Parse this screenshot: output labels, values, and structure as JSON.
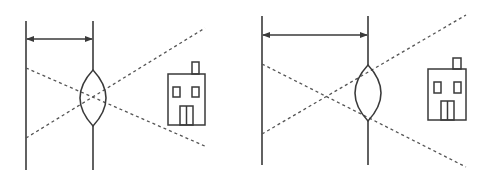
{
  "diagram": {
    "colors": {
      "stroke": "#3a3a3a",
      "dash": "#555555",
      "background": "#ffffff"
    },
    "panels": [
      {
        "id": "left",
        "screen_x": 26,
        "lens_x": 93,
        "line_top": 21,
        "line_bottom": 170,
        "arrow_y": 39,
        "lens": {
          "cx": 93,
          "top": 70,
          "bottom": 126,
          "half_width": 13
        },
        "rays": [
          {
            "x1": 26,
            "y1": 68,
            "x2": 207,
            "y2": 147
          },
          {
            "x1": 26,
            "y1": 138,
            "x2": 205,
            "y2": 28
          }
        ],
        "house": {
          "x": 168,
          "y": 74,
          "w": 37,
          "h": 51,
          "chimney": {
            "x": 192,
            "y": 62,
            "w": 7,
            "h": 12
          },
          "windows": [
            {
              "x": 173,
              "y": 87,
              "w": 7,
              "h": 10
            },
            {
              "x": 192,
              "y": 87,
              "w": 7,
              "h": 10
            }
          ],
          "door": {
            "x": 180,
            "y": 106,
            "w": 13,
            "h": 19
          }
        }
      },
      {
        "id": "right",
        "screen_x": 262,
        "lens_x": 368,
        "line_top": 16,
        "line_bottom": 165,
        "arrow_y": 35,
        "lens": {
          "cx": 368,
          "top": 65,
          "bottom": 121,
          "half_width": 13
        },
        "rays": [
          {
            "x1": 262,
            "y1": 64,
            "x2": 466,
            "y2": 167
          },
          {
            "x1": 262,
            "y1": 134,
            "x2": 466,
            "y2": 15
          }
        ],
        "house": {
          "x": 428,
          "y": 69,
          "w": 38,
          "h": 51,
          "chimney": {
            "x": 453,
            "y": 58,
            "w": 8,
            "h": 11
          },
          "windows": [
            {
              "x": 434,
              "y": 82,
              "w": 7,
              "h": 11
            },
            {
              "x": 454,
              "y": 82,
              "w": 7,
              "h": 11
            }
          ],
          "door": {
            "x": 441,
            "y": 101,
            "w": 13,
            "h": 19
          }
        }
      }
    ]
  }
}
